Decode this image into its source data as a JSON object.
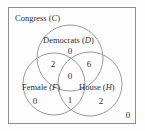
{
  "diagram": {
    "type": "venn-3-set",
    "universe": {
      "name": "Congress",
      "symbol": "C",
      "label": "Congress (C)",
      "outside_count": "0"
    },
    "sets": [
      {
        "id": "D",
        "name": "Democrats",
        "symbol": "D",
        "label": "Democrats (D)",
        "only_count": "0"
      },
      {
        "id": "F",
        "name": "Female",
        "symbol": "F",
        "label": "Female (F)",
        "only_count": "0"
      },
      {
        "id": "H",
        "name": "House",
        "symbol": "H",
        "label": "House (H)",
        "only_count": "2"
      }
    ],
    "regions": {
      "D_only": "0",
      "F_only": "0",
      "H_only": "2",
      "F_and_D": "2",
      "D_and_H": "6",
      "F_and_H": "1",
      "F_and_D_and_H": "0",
      "outside_all": "0"
    },
    "colors": {
      "circle_stroke": "#9a9a9a",
      "rect_stroke": "#8d8d8d",
      "text": "#2e2e2e",
      "background": "#fdfdfd"
    }
  }
}
